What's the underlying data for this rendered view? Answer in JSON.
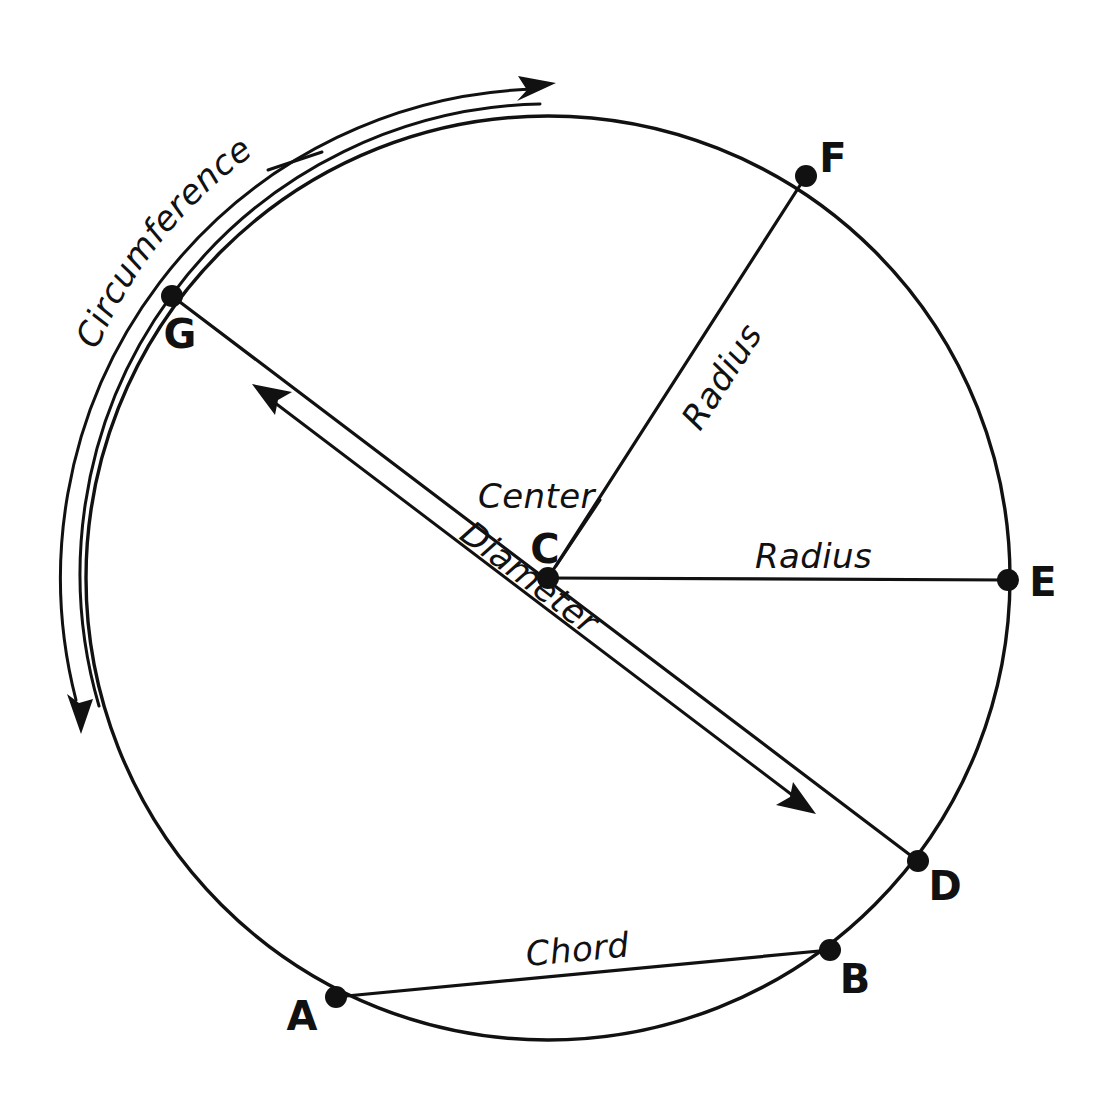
{
  "diagram": {
    "type": "geometry-circle-diagram",
    "stroke_color": "#111111",
    "background_color": "#ffffff",
    "canvas": {
      "width": 1110,
      "height": 1102
    },
    "circle": {
      "center_x": 548,
      "center_y": 578,
      "radius": 462
    },
    "points": [
      {
        "id": "A",
        "label": "A",
        "x": 336,
        "y": 997,
        "label_x": 302,
        "label_y": 1030
      },
      {
        "id": "B",
        "label": "B",
        "x": 830,
        "y": 950,
        "label_x": 845,
        "label_y": 990
      },
      {
        "id": "C",
        "label": "C",
        "x": 548,
        "y": 578,
        "label_x": 532,
        "label_y": 563
      },
      {
        "id": "D",
        "label": "D",
        "x": 918,
        "y": 861,
        "label_x": 930,
        "label_y": 900
      },
      {
        "id": "E",
        "label": "E",
        "x": 1008,
        "y": 580,
        "label_x": 1030,
        "label_y": 595
      },
      {
        "id": "F",
        "label": "F",
        "x": 806,
        "y": 176,
        "label_x": 820,
        "label_y": 172
      },
      {
        "id": "G",
        "label": "G",
        "x": 172,
        "y": 296,
        "label_x": 160,
        "label_y": 348
      }
    ],
    "labels": {
      "circumference": "Circumference",
      "center": "Center",
      "radius_upper": "Radius",
      "radius_right": "Radius",
      "diameter": "Diameter",
      "chord": "Chord"
    },
    "segments": [
      {
        "name": "radius-c-f",
        "from": "C",
        "to": "F",
        "label": "Radius"
      },
      {
        "name": "radius-c-e",
        "from": "C",
        "to": "E",
        "label": "Radius"
      },
      {
        "name": "diameter-g-d",
        "from": "G",
        "to": "D",
        "label": "Diameter"
      },
      {
        "name": "chord-a-b",
        "from": "A",
        "to": "B",
        "label": "Chord"
      }
    ],
    "annotations": {
      "circumference_arrow": "double-headed curved arrow following the circle outline",
      "diameter_arrow": "double-headed straight arrow parallel to segment GD",
      "center_leader": "short line from the word Center to point C"
    }
  }
}
